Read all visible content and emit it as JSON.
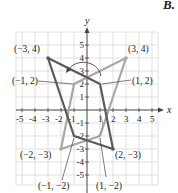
{
  "corner_label": "B.",
  "axes": {
    "x_label": "x",
    "y_label": "y",
    "x_ticks": [
      "-5",
      "-4",
      "-3",
      "-2",
      "-1",
      "1",
      "2",
      "3",
      "4",
      "5"
    ],
    "y_ticks": [
      "5",
      "4",
      "3",
      "2",
      "1",
      "-1",
      "-2",
      "-3",
      "-4",
      "-5"
    ],
    "range": [
      -5,
      5
    ]
  },
  "colors": {
    "grid": "#d9d9d9",
    "axis": "#444444",
    "original_shape": "#5a5a5a",
    "reflected_shape": "#a8a8a8",
    "text": "#222222"
  },
  "shapes": {
    "original": {
      "name": "dark quadrilateral",
      "vertices": [
        [
          -3,
          4
        ],
        [
          1,
          2
        ],
        [
          2,
          -3
        ],
        [
          -1,
          -2
        ]
      ]
    },
    "reflected": {
      "name": "light quadrilateral",
      "vertices": [
        [
          3,
          4
        ],
        [
          -1,
          2
        ],
        [
          -2,
          -3
        ],
        [
          1,
          -2
        ]
      ]
    }
  },
  "point_labels": {
    "p1": "(−3, 4)",
    "p2": "(3, 4)",
    "p3": "(−1, 2)",
    "p4": "(1, 2)",
    "p5": "(−2, −3)",
    "p6": "(2, −3)",
    "p7": "(−1, −2)",
    "p8": "(1, −2)"
  },
  "annotations": {
    "rotation_arrow": "curved arrow above origin indicating reflection across y-axis"
  }
}
